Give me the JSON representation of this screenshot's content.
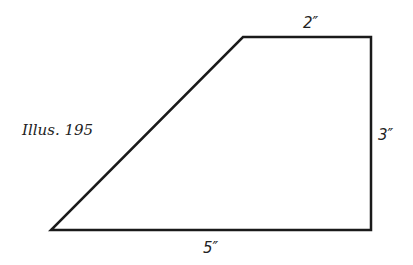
{
  "figure": {
    "caption": "Illus. 195",
    "shape": "trapezoid",
    "stroke_color": "#1a1a1a",
    "vertices": [
      [
        243,
        37
      ],
      [
        371,
        37
      ],
      [
        371,
        230
      ],
      [
        51,
        230
      ]
    ],
    "labels": {
      "top": "2″",
      "right": "3″",
      "bottom": "5″"
    }
  }
}
